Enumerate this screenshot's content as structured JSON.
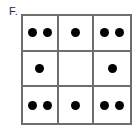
{
  "figure": {
    "label": "F.",
    "type": "dot-pattern-grid",
    "grid": {
      "rows": 3,
      "columns": 3,
      "border_color": "#6e6e6e",
      "dot_color": "#000000",
      "background_color": "#ffffff"
    },
    "cells": [
      {
        "row": 1,
        "col": 1,
        "dots": 2
      },
      {
        "row": 1,
        "col": 2,
        "dots": 1
      },
      {
        "row": 1,
        "col": 3,
        "dots": 2
      },
      {
        "row": 2,
        "col": 1,
        "dots": 1
      },
      {
        "row": 2,
        "col": 2,
        "dots": 0
      },
      {
        "row": 2,
        "col": 3,
        "dots": 1
      },
      {
        "row": 3,
        "col": 1,
        "dots": 2
      },
      {
        "row": 3,
        "col": 2,
        "dots": 1
      },
      {
        "row": 3,
        "col": 3,
        "dots": 2
      }
    ]
  }
}
